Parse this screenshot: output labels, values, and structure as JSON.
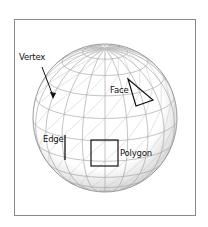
{
  "figure": {
    "labels": {
      "vertex": "Vertex",
      "face": "Face",
      "edge": "Edge",
      "polygon": "Polygon"
    },
    "colors": {
      "frame": "#8a8a8a",
      "mesh": "#9a9a9a",
      "highlight": "#111111",
      "background": "#ffffff"
    }
  }
}
